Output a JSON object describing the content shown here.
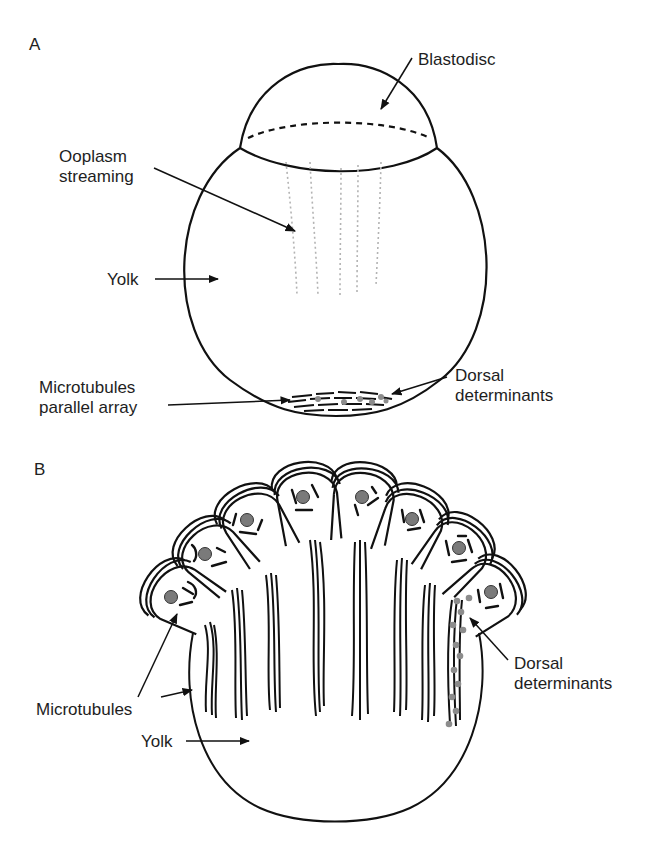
{
  "figure": {
    "type": "scientific-illustration",
    "colors": {
      "line": "#111111",
      "nucleus": "#7a7a7a",
      "determinants": "#8c8c8c",
      "streaming": "#b8b8b8",
      "background": "#ffffff"
    }
  },
  "panels": [
    {
      "letter": "A",
      "labels": {
        "blastodisc": "Blastodisc",
        "ooplasm_line1": "Ooplasm",
        "ooplasm_line2": "streaming",
        "yolk": "Yolk",
        "microtubules_line1": "Microtubules",
        "microtubules_line2": "parallel array",
        "dorsal_line1": "Dorsal",
        "dorsal_line2": "determinants"
      }
    },
    {
      "letter": "B",
      "labels": {
        "microtubules": "Microtubules",
        "yolk": "Yolk",
        "dorsal_line1": "Dorsal",
        "dorsal_line2": "determinants"
      },
      "cell_count": 8
    }
  ]
}
